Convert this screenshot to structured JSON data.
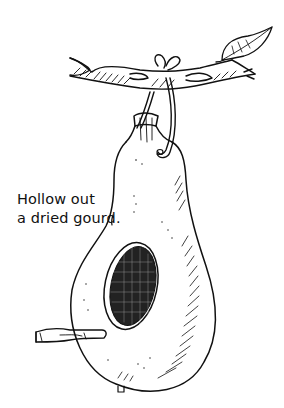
{
  "caption": {
    "line1": "Hollow out",
    "line2": "a dried gourd."
  },
  "illustration": {
    "subject": "gourd birdhouse hanging from a branch",
    "elements": [
      "branch",
      "leaf",
      "hanging-loop",
      "gourd",
      "entrance-hole",
      "perch-stick"
    ],
    "colors": {
      "ink": "#111111",
      "paper": "#ffffff"
    }
  }
}
